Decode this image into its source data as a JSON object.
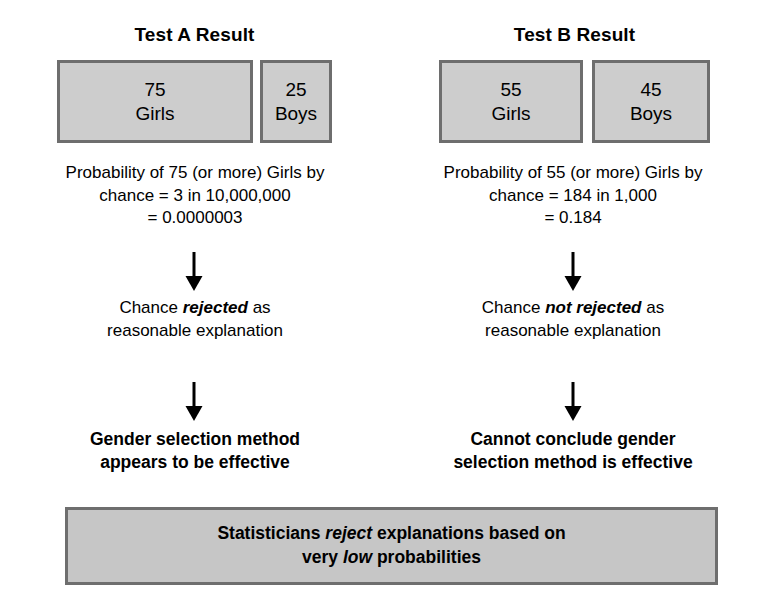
{
  "figure": {
    "type": "flowchart",
    "background_color": "#ffffff",
    "box_fill": "#cdcdcd",
    "box_border": "#6e6e6e",
    "text_color": "#000000"
  },
  "columns": [
    {
      "id": "test-a",
      "title": "Test A Result",
      "groups": [
        {
          "count": "75",
          "label": "Girls"
        },
        {
          "count": "25",
          "label": "Boys"
        }
      ],
      "probability": "Probability of 75 (or more) Girls by\nchance = 3 in 10,000,000\n= 0.0000003",
      "verdict_prefix": "Chance ",
      "verdict_emphasis": "rejected",
      "verdict_suffix": " as\nreasonable explanation",
      "conclusion": "Gender selection method\nappears to be effective"
    },
    {
      "id": "test-b",
      "title": "Test B Result",
      "groups": [
        {
          "count": "55",
          "label": "Girls"
        },
        {
          "count": "45",
          "label": "Boys"
        }
      ],
      "probability": "Probability of 55 (or more) Girls by\nchance = 184 in 1,000\n= 0.184",
      "verdict_prefix": "Chance ",
      "verdict_emphasis": "not rejected",
      "verdict_suffix": " as\nreasonable explanation",
      "conclusion": "Cannot conclude gender\nselection method is effective"
    }
  ],
  "summary": {
    "part1": "Statisticians ",
    "emphasis1": "reject",
    "part2": " explanations based on\nvery ",
    "emphasis2": "low",
    "part3": " probabilities"
  },
  "arrows": {
    "icon": "down-arrow-icon",
    "count": 4
  }
}
